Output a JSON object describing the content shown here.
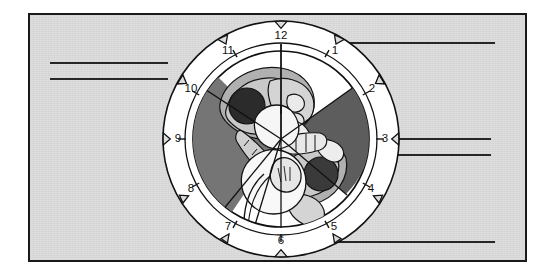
{
  "figure": {
    "panel": {
      "background_color": "#dcdcdc",
      "border_color": "#1a1a1a"
    }
  },
  "clock": {
    "name": "clock-face",
    "hour_labels": [
      {
        "hour": "12",
        "x": 121,
        "y": 18
      },
      {
        "hour": "1",
        "x": 175,
        "y": 33
      },
      {
        "hour": "2",
        "x": 212,
        "y": 71
      },
      {
        "hour": "3",
        "x": 225,
        "y": 121
      },
      {
        "hour": "4",
        "x": 211,
        "y": 171
      },
      {
        "hour": "5",
        "x": 174,
        "y": 209
      },
      {
        "hour": "6",
        "x": 121,
        "y": 223
      },
      {
        "hour": "7",
        "x": 68,
        "y": 209
      },
      {
        "hour": "8",
        "x": 31,
        "y": 171
      },
      {
        "hour": "9",
        "x": 18,
        "y": 121
      },
      {
        "hour": "10",
        "x": 31,
        "y": 71
      },
      {
        "hour": "11",
        "x": 68,
        "y": 33
      }
    ],
    "ring": {
      "outer_radius": 118,
      "inner_radius": 96,
      "dial_radius": 88,
      "fill_color": "#ffffff",
      "stroke_color": "#111111"
    },
    "sectors": [
      {
        "name": "upper-left-shaded-sector",
        "fill": "#7a7a7a"
      },
      {
        "name": "right-shaded-sector",
        "fill": "#606060"
      }
    ]
  },
  "illustration": {
    "name": "twin-fetuses-in-utero",
    "colors": {
      "dark_sector": "#6e6e6e",
      "mid_gray": "#a8a8a8",
      "light_gray": "#d2d2d2",
      "head_dark": "#2b2b2b",
      "head_dark_2": "#3c3c3c",
      "outline": "#141414",
      "skin_light": "#f4f4f4"
    }
  },
  "answer_lines": [
    {
      "name": "answer-line-top-right",
      "left": 310,
      "top": 42,
      "width": 185
    },
    {
      "name": "answer-line-left-upper",
      "left": 50,
      "top": 62,
      "width": 118
    },
    {
      "name": "answer-line-left-lower",
      "left": 50,
      "top": 78,
      "width": 118
    },
    {
      "name": "answer-line-right-upper",
      "left": 378,
      "top": 138,
      "width": 113
    },
    {
      "name": "answer-line-right-lower",
      "left": 378,
      "top": 154,
      "width": 113
    },
    {
      "name": "answer-line-bottom-right",
      "left": 313,
      "top": 241,
      "width": 182
    }
  ]
}
